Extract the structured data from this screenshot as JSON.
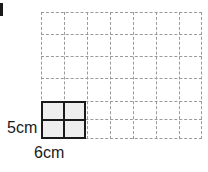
{
  "figure": {
    "background_color": "#ffffff"
  },
  "corner_mark": {
    "name": "corner-tick",
    "color": "#1a1a1a"
  },
  "grid": {
    "line_style": "dashed",
    "line_color": "#9a9a9a",
    "columns": 7,
    "rows": 6,
    "cell_width": 23,
    "cell_height": 22,
    "vertical_line_offsets": [
      0,
      23,
      46,
      69,
      92,
      115,
      138,
      160
    ],
    "horizontal_line_offsets": [
      0,
      22,
      44,
      66,
      89,
      107,
      126
    ]
  },
  "shape": {
    "name": "shaded-rectangle",
    "fill_color": "#eeeeee",
    "border_color": "#1a1a1a",
    "subdivisions_x": 2,
    "subdivisions_y": 2
  },
  "labels": {
    "height": "5cm",
    "width": "6cm"
  }
}
